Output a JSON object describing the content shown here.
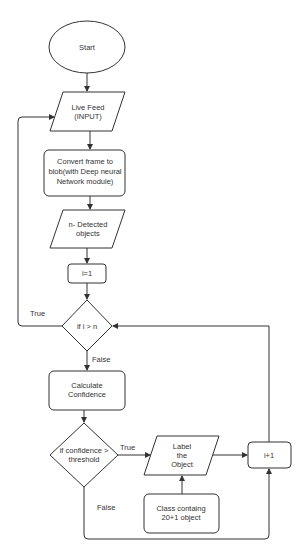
{
  "diagram": {
    "type": "flowchart",
    "nodes": {
      "start": {
        "shape": "ellipse",
        "lines": [
          "Start"
        ]
      },
      "live_feed": {
        "shape": "parallelogram",
        "lines": [
          "Live Feed",
          "(INPUT)"
        ]
      },
      "convert": {
        "shape": "rounded-rect",
        "lines": [
          "Convert frame to",
          "blob(with Deep neural",
          "Network module)"
        ]
      },
      "detected": {
        "shape": "parallelogram",
        "lines": [
          "n- Detected",
          "objects"
        ]
      },
      "init_i": {
        "shape": "rounded-rect",
        "lines": [
          "i=1"
        ]
      },
      "check_i": {
        "shape": "diamond",
        "lines": [
          "if i > n"
        ]
      },
      "calc_conf": {
        "shape": "rounded-rect",
        "lines": [
          "Calculate",
          "Confidence"
        ]
      },
      "check_conf": {
        "shape": "diamond",
        "lines": [
          "if confidence >",
          "threshold"
        ]
      },
      "label_obj": {
        "shape": "parallelogram",
        "lines": [
          "Label",
          "the",
          "Object"
        ]
      },
      "incr_i": {
        "shape": "rounded-rect",
        "lines": [
          "i+1"
        ]
      },
      "classes": {
        "shape": "rounded-rect",
        "lines": [
          "Class containg",
          "20+1 object"
        ]
      }
    },
    "edges": [
      {
        "from": "start",
        "to": "live_feed",
        "label": ""
      },
      {
        "from": "live_feed",
        "to": "convert",
        "label": ""
      },
      {
        "from": "convert",
        "to": "detected",
        "label": ""
      },
      {
        "from": "detected",
        "to": "init_i",
        "label": ""
      },
      {
        "from": "init_i",
        "to": "check_i",
        "label": ""
      },
      {
        "from": "check_i",
        "to": "live_feed",
        "label": "True"
      },
      {
        "from": "check_i",
        "to": "calc_conf",
        "label": "False"
      },
      {
        "from": "calc_conf",
        "to": "check_conf",
        "label": ""
      },
      {
        "from": "check_conf",
        "to": "label_obj",
        "label": "True"
      },
      {
        "from": "check_conf",
        "to": "incr_i",
        "label": "False"
      },
      {
        "from": "classes",
        "to": "label_obj",
        "label": ""
      },
      {
        "from": "label_obj",
        "to": "incr_i",
        "label": ""
      },
      {
        "from": "incr_i",
        "to": "check_i",
        "label": ""
      }
    ],
    "edge_labels": {
      "check_i_true": "True",
      "check_i_false": "False",
      "check_conf_true": "True",
      "check_conf_false": "False"
    }
  }
}
